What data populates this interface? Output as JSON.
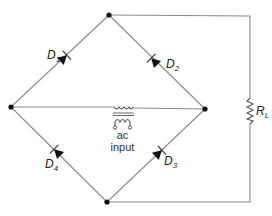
{
  "diagram": {
    "diodes": [
      {
        "name": "D",
        "sub": "1"
      },
      {
        "name": "D",
        "sub": "2"
      },
      {
        "name": "D",
        "sub": "3"
      },
      {
        "name": "D",
        "sub": "4"
      }
    ],
    "load": {
      "name": "R",
      "sub": "L"
    },
    "source": {
      "line1": "ac",
      "line2": "input"
    },
    "colors": {
      "wire": "#8a8a8a",
      "node": "#111111",
      "background": "#ffffff"
    }
  }
}
